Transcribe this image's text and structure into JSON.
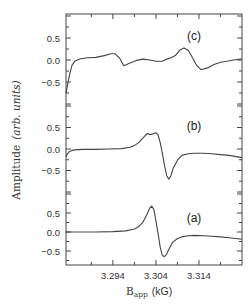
{
  "chart_data": {
    "type": "line",
    "title": "",
    "xlabel": "B_app (kG)",
    "xlabel_main": "B",
    "xlabel_sub": "app",
    "xlabel_unit": "(kG)",
    "ylabel": "Amplitude (arb. units)",
    "ylabel_main": "Amplitude",
    "ylabel_units": "(arb. units)",
    "xlim": [
      3.2831,
      3.324
    ],
    "x_ticks": [
      3.294,
      3.304,
      3.314
    ],
    "x_tick_labels": [
      "3.294",
      "3.304",
      "3.314"
    ],
    "x_minor_ticks": [
      3.289,
      3.299,
      3.309,
      3.319
    ],
    "grid": false,
    "legend": "none",
    "panels": [
      {
        "label": "(c)",
        "y_ticks": [
          0.5,
          0.0,
          -0.5
        ],
        "y_tick_labels": [
          "0.5",
          "0.0",
          "-0.5"
        ],
        "ylim": [
          -1.05,
          1.05
        ],
        "series": {
          "name": "(c)",
          "x": [
            3.2831,
            3.2835,
            3.284,
            3.2845,
            3.2852,
            3.2865,
            3.288,
            3.29,
            3.292,
            3.2935,
            3.2945,
            3.2955,
            3.2965,
            3.298,
            3.2995,
            3.301,
            3.3025,
            3.304,
            3.3055,
            3.3065,
            3.3075,
            3.3085,
            3.3095,
            3.3105,
            3.3115,
            3.3125,
            3.3135,
            3.3145,
            3.316,
            3.3175,
            3.319,
            3.3205,
            3.322,
            3.324
          ],
          "y": [
            -0.75,
            -0.55,
            -0.3,
            -0.12,
            -0.02,
            0.03,
            0.05,
            0.06,
            0.1,
            0.14,
            0.14,
            0.05,
            -0.13,
            -0.07,
            -0.01,
            0.02,
            0.0,
            -0.03,
            -0.03,
            0.02,
            0.05,
            0.1,
            0.22,
            0.27,
            0.22,
            0.05,
            -0.13,
            -0.22,
            -0.18,
            -0.1,
            -0.05,
            -0.03,
            0.0,
            0.03
          ]
        }
      },
      {
        "label": "(b)",
        "y_ticks": [
          0.5,
          0.0,
          -0.5
        ],
        "y_tick_labels": [
          "0.5",
          "0.0",
          "-0.5"
        ],
        "ylim": [
          -1.05,
          1.05
        ],
        "series": {
          "name": "(b)",
          "x": [
            3.2831,
            3.2835,
            3.284,
            3.285,
            3.287,
            3.29,
            3.293,
            3.296,
            3.298,
            3.299,
            3.3,
            3.301,
            3.302,
            3.3025,
            3.303,
            3.3035,
            3.304,
            3.3045,
            3.305,
            3.3055,
            3.306,
            3.3065,
            3.307,
            3.3075,
            3.308,
            3.309,
            3.31,
            3.3115,
            3.313,
            3.315,
            3.317,
            3.319,
            3.321,
            3.324
          ],
          "y": [
            -0.18,
            -0.1,
            -0.05,
            -0.02,
            -0.01,
            -0.01,
            0.0,
            0.01,
            0.04,
            0.08,
            0.15,
            0.26,
            0.36,
            0.34,
            0.34,
            0.36,
            0.38,
            0.33,
            0.15,
            -0.1,
            -0.38,
            -0.62,
            -0.7,
            -0.62,
            -0.45,
            -0.26,
            -0.15,
            -0.11,
            -0.1,
            -0.1,
            -0.11,
            -0.13,
            -0.15,
            -0.2
          ]
        }
      },
      {
        "label": "(a)",
        "y_ticks": [
          0.5,
          0.0,
          -0.5
        ],
        "y_tick_labels": [
          "0.5",
          "0.0",
          "-0.5"
        ],
        "ylim": [
          -0.95,
          1.0
        ],
        "series": {
          "name": "(a)",
          "x": [
            3.2831,
            3.286,
            3.29,
            3.294,
            3.297,
            3.299,
            3.3,
            3.301,
            3.302,
            3.3025,
            3.303,
            3.3035,
            3.304,
            3.3045,
            3.305,
            3.3055,
            3.306,
            3.3065,
            3.307,
            3.3075,
            3.308,
            3.309,
            3.31,
            3.3115,
            3.313,
            3.315,
            3.317,
            3.319,
            3.321,
            3.324
          ],
          "y": [
            0.0,
            0.0,
            0.0,
            0.01,
            0.03,
            0.08,
            0.14,
            0.26,
            0.48,
            0.62,
            0.68,
            0.6,
            0.3,
            -0.05,
            -0.4,
            -0.62,
            -0.65,
            -0.58,
            -0.46,
            -0.35,
            -0.26,
            -0.17,
            -0.13,
            -0.1,
            -0.09,
            -0.1,
            -0.11,
            -0.13,
            -0.15,
            -0.19
          ]
        }
      }
    ]
  },
  "layout": {
    "frame": {
      "left": 66,
      "right": 242,
      "top": 14,
      "bottom": 265
    },
    "panel_zero_px": [
      60,
      149,
      232
    ],
    "panel_half_unit_px": [
      22,
      21.5,
      19
    ],
    "panel_label_pos": [
      [
        194,
        40
      ],
      [
        194,
        130
      ],
      [
        194,
        222
      ]
    ]
  },
  "colors": {
    "line": "#444444",
    "text": "#333333",
    "background": "#ffffff"
  }
}
